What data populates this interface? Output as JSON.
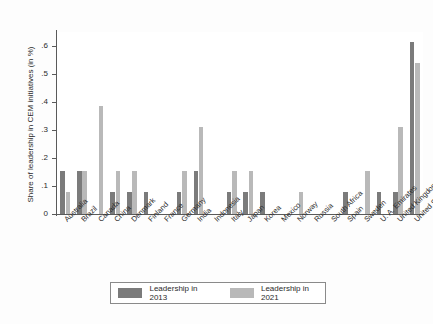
{
  "chart_data": {
    "type": "bar",
    "title": "",
    "xlabel": "",
    "ylabel": "Share of leadership in CEM initiatives (in %)",
    "ylim": [
      0,
      0.65
    ],
    "yticks": [
      0,
      0.1,
      0.2,
      0.3,
      0.4,
      0.5,
      0.6
    ],
    "ytick_labels": [
      "0",
      ".1",
      ".2",
      ".3",
      ".4",
      ".5",
      ".6"
    ],
    "grid": false,
    "legend_position": "bottom-center",
    "categories": [
      "Australia",
      "Brazil",
      "Canada",
      "China",
      "Denmark",
      "Finland",
      "France",
      "Germany",
      "India",
      "Indonesia",
      "Italy",
      "Japan",
      "Korea",
      "Mexico",
      "Norway",
      "Russia",
      "South Africa",
      "Spain",
      "Sweden",
      "U. A. Emirates",
      "United Kingdom",
      "United States"
    ],
    "series": [
      {
        "name": "Leadership in 2013",
        "color": "#7b7b7b",
        "values": [
          0.155,
          0.155,
          0.0,
          0.077,
          0.077,
          0.077,
          0.0,
          0.077,
          0.155,
          0.0,
          0.077,
          0.077,
          0.077,
          0.0,
          0.0,
          0.0,
          0.0,
          0.077,
          0.0,
          0.077,
          0.077,
          0.615
        ]
      },
      {
        "name": "Leadership in 2021",
        "color": "#b9b9b9",
        "values": [
          0.077,
          0.155,
          0.385,
          0.155,
          0.155,
          0.0,
          0.0,
          0.155,
          0.31,
          0.0,
          0.155,
          0.155,
          0.0,
          0.0,
          0.077,
          0.0,
          0.0,
          0.0,
          0.155,
          0.0,
          0.31,
          0.54
        ]
      }
    ]
  },
  "legend": {
    "items": [
      {
        "label": "Leadership in 2013",
        "color": "#7b7b7b"
      },
      {
        "label": "Leadership in 2021",
        "color": "#b9b9b9"
      }
    ]
  }
}
